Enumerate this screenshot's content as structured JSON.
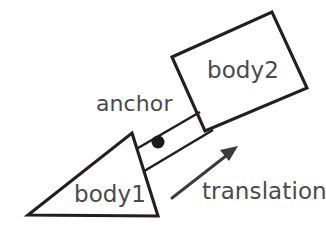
{
  "diagram": {
    "type": "prismatic-joint-illustration",
    "canvas": {
      "width": 326,
      "height": 230,
      "background": "#ffffff"
    },
    "colors": {
      "stroke": "#231f20",
      "text": "#4a4a4a",
      "arrow": "#3b3b3b",
      "anchor_dot": "#1a1a1a",
      "fill": "#ffffff"
    },
    "labels": {
      "body1": "body1",
      "body2": "body2",
      "anchor": "anchor",
      "translation": "translation"
    },
    "shapes": {
      "body1_triangle": {
        "name": "body1",
        "kind": "triangle",
        "points": "132,133 158,216 28,215"
      },
      "body2_quad": {
        "name": "body2",
        "kind": "quadrilateral",
        "points": "172,57 272,12 307,88 205,131"
      },
      "anchor_point": {
        "cx": 158,
        "cy": 142,
        "r": 6.5
      },
      "rod_upper": {
        "x1": 126,
        "y1": 155,
        "x2": 200,
        "y2": 112
      },
      "rod_lower": {
        "x1": 141,
        "y1": 173,
        "x2": 213,
        "y2": 130
      },
      "translation_arrow": {
        "shaft": {
          "x1": 172,
          "y1": 198,
          "x2": 231,
          "y2": 152
        },
        "head": "238,146 220,150 229,161"
      }
    }
  }
}
